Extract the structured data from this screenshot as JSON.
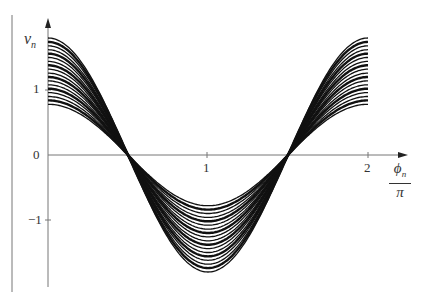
{
  "chart_data": {
    "type": "line",
    "title": "",
    "xlabel": "φn / π",
    "ylabel": "vn",
    "xlim": [
      0,
      2.2
    ],
    "ylim": [
      -1.95,
      2.1
    ],
    "xticks": [
      1,
      2
    ],
    "yticks": [
      -1,
      0,
      1
    ],
    "grid": false,
    "legend": null,
    "function": "v = A·cos(π·x), x ∈ [0, 2]",
    "series": [
      {
        "name": "A=0.78",
        "amplitude": 0.78
      },
      {
        "name": "A=0.84",
        "amplitude": 0.84
      },
      {
        "name": "A=0.90",
        "amplitude": 0.9
      },
      {
        "name": "A=0.96",
        "amplitude": 0.96
      },
      {
        "name": "A=1.02",
        "amplitude": 1.02
      },
      {
        "name": "A=1.08",
        "amplitude": 1.08
      },
      {
        "name": "A=1.14",
        "amplitude": 1.14
      },
      {
        "name": "A=1.20",
        "amplitude": 1.2
      },
      {
        "name": "A=1.26",
        "amplitude": 1.26
      },
      {
        "name": "A=1.32",
        "amplitude": 1.32
      },
      {
        "name": "A=1.38",
        "amplitude": 1.38
      },
      {
        "name": "A=1.44",
        "amplitude": 1.44
      },
      {
        "name": "A=1.50",
        "amplitude": 1.5
      },
      {
        "name": "A=1.56",
        "amplitude": 1.56
      },
      {
        "name": "A=1.62",
        "amplitude": 1.62
      },
      {
        "name": "A=1.68",
        "amplitude": 1.68
      },
      {
        "name": "A=1.74",
        "amplitude": 1.74
      },
      {
        "name": "A=1.80",
        "amplitude": 1.8
      }
    ]
  },
  "labels": {
    "y_axis": "v",
    "y_axis_sub": "n",
    "x_axis_num": "ϕ",
    "x_axis_sub": "n",
    "x_axis_den": "π",
    "tick_y_1": "1",
    "tick_y_0": "0",
    "tick_y_m1": "−1",
    "tick_x_1": "1",
    "tick_x_2": "2"
  }
}
